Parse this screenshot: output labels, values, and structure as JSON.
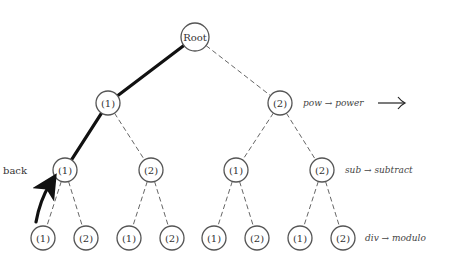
{
  "diagram": {
    "root": {
      "label": "Root",
      "x": 195,
      "y": 37
    },
    "level1": [
      {
        "label": "(1)",
        "x": 108,
        "y": 103
      },
      {
        "label": "(2)",
        "x": 280,
        "y": 103
      }
    ],
    "level2": [
      {
        "label": "(1)",
        "x": 65,
        "y": 170
      },
      {
        "label": "(2)",
        "x": 151,
        "y": 170
      },
      {
        "label": "(1)",
        "x": 236,
        "y": 170
      },
      {
        "label": "(2)",
        "x": 322,
        "y": 170
      }
    ],
    "level3": [
      {
        "label": "(1)",
        "x": 43,
        "y": 238
      },
      {
        "label": "(2)",
        "x": 86,
        "y": 238
      },
      {
        "label": "(1)",
        "x": 129,
        "y": 238
      },
      {
        "label": "(2)",
        "x": 172,
        "y": 238
      },
      {
        "label": "(1)",
        "x": 214,
        "y": 238
      },
      {
        "label": "(2)",
        "x": 257,
        "y": 238
      },
      {
        "label": "(1)",
        "x": 300,
        "y": 238
      },
      {
        "label": "(2)",
        "x": 343,
        "y": 238
      }
    ],
    "bold_path": [
      "Root",
      "level1.0",
      "level2.0"
    ],
    "back_label": "back",
    "annotations": [
      {
        "text": "pow → power",
        "x": 303,
        "y": 103
      },
      {
        "text": "sub → subtract",
        "x": 345,
        "y": 170
      },
      {
        "text": "div → modulo",
        "x": 365,
        "y": 238
      }
    ],
    "next_arrow": "⟶",
    "colors": {
      "bold_edge": "#111111",
      "dashed_edge": "#666666",
      "node_stroke": "#555555"
    }
  }
}
